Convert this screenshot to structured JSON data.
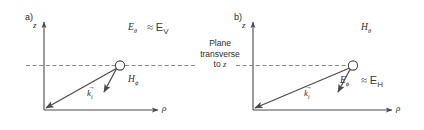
{
  "figure": {
    "width": 424,
    "height": 130,
    "background": "#ffffff",
    "stroke_color": "#4a4a4a",
    "dash_color": "#7a7a7a",
    "text_color": "#2b2b2b"
  },
  "center_note": {
    "line1": "Plane",
    "line2": "transverse",
    "line3_prefix": "to ",
    "line3_var": "z"
  },
  "panels": [
    {
      "id": "a",
      "label": "a)",
      "axis_z": "z",
      "axis_rho": "ρ",
      "field_vector": {
        "symbol": "E",
        "subscript": "θ",
        "approx": "≈",
        "equivalent": "E",
        "equivalent_sub": "V"
      },
      "other_field": {
        "symbol": "H",
        "subscript": "ϕ"
      },
      "wave_vector": {
        "symbol": "k",
        "subscript": "i"
      }
    },
    {
      "id": "b",
      "label": "b)",
      "axis_z": "z",
      "axis_rho": "ρ",
      "field_vector": {
        "symbol": "H",
        "subscript": "θ"
      },
      "other_field": {
        "symbol": "E",
        "subscript": "ϕ",
        "approx": "≈",
        "equivalent": "E",
        "equivalent_sub": "H"
      },
      "wave_vector": {
        "symbol": "k",
        "subscript": "i"
      }
    }
  ]
}
